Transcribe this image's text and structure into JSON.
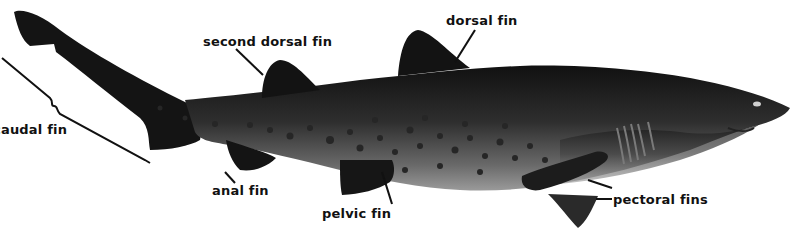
{
  "diagram": {
    "labels": {
      "caudal_fin": "caudal fin",
      "second_dorsal_fin": "second dorsal fin",
      "dorsal_fin": "dorsal fin",
      "anal_fin": "anal fin",
      "pelvic_fin": "pelvic fin",
      "pectoral_fins": "pectoral fins"
    },
    "colors": {
      "background": "#ffffff",
      "body_dark": "#151515",
      "body_mid": "#3a3a3a",
      "belly": "#8a8a8a",
      "spots": "#2a2a2a",
      "label_text": "#111111",
      "leader_lines": "#111111"
    }
  }
}
